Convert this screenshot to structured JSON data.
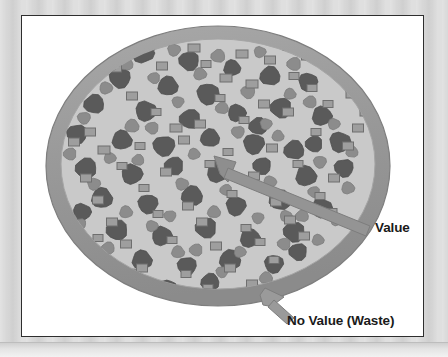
{
  "diagram": {
    "type": "conceptual-illustration",
    "labels": {
      "value": "Value",
      "no_value": "No Value (Waste)"
    },
    "colors": {
      "backdrop": "#d6d6d6",
      "panel_background": "#ffffff",
      "panel_border": "#2e2e2e",
      "disc_rim": "#9a9a9a",
      "disc_rim_edge": "#7e7e7e",
      "disc_interior": "#c9c9c9",
      "particle_dark": "#5a5a5a",
      "particle_medium": "#8c8c8c",
      "square_fill": "#9e9e9e",
      "square_border": "#6e6e6e",
      "arrow": "#8e8e8e",
      "arrow_edge": "#777777",
      "label_text": "#1a1a1a"
    },
    "legend_semantics": [
      {
        "shape": "circle-dark",
        "meaning": "Value"
      },
      {
        "shape": "circle-medium",
        "meaning": "Value"
      },
      {
        "shape": "square",
        "meaning": "Value"
      },
      {
        "shape": "rim-annulus",
        "meaning": "No Value (Waste)"
      }
    ],
    "disc": {
      "center_x": 196,
      "center_y": 148,
      "outer_rx": 172,
      "outer_ry": 140,
      "rim_thickness": 15
    },
    "callouts": [
      {
        "name": "value",
        "label": "Value",
        "tip_x": 192,
        "tip_y": 140,
        "tail_x": 348,
        "tail_y": 214
      },
      {
        "name": "no-value",
        "label": "No Value (Waste)",
        "tip_x": 243,
        "tip_y": 272,
        "tail_x": 268,
        "tail_y": 300
      }
    ],
    "particles_dark": [
      [
        121,
        37,
        17,
        15
      ],
      [
        167,
        45,
        15,
        14
      ],
      [
        210,
        52,
        12,
        11
      ],
      [
        98,
        62,
        16,
        15
      ],
      [
        146,
        70,
        15,
        14
      ],
      [
        186,
        78,
        17,
        16
      ],
      [
        248,
        60,
        15,
        14
      ],
      [
        286,
        66,
        14,
        13
      ],
      [
        72,
        88,
        15,
        14
      ],
      [
        124,
        95,
        16,
        15
      ],
      [
        168,
        103,
        16,
        14
      ],
      [
        215,
        97,
        13,
        12
      ],
      [
        259,
        92,
        16,
        15
      ],
      [
        300,
        100,
        15,
        14
      ],
      [
        55,
        118,
        15,
        14
      ],
      [
        100,
        124,
        15,
        14
      ],
      [
        142,
        130,
        17,
        15
      ],
      [
        188,
        122,
        14,
        13
      ],
      [
        232,
        128,
        16,
        15
      ],
      [
        272,
        134,
        15,
        14
      ],
      [
        318,
        126,
        16,
        15
      ],
      [
        64,
        152,
        16,
        15
      ],
      [
        110,
        158,
        16,
        15
      ],
      [
        152,
        150,
        14,
        13
      ],
      [
        196,
        156,
        17,
        16
      ],
      [
        240,
        150,
        13,
        12
      ],
      [
        284,
        160,
        16,
        15
      ],
      [
        322,
        152,
        14,
        13
      ],
      [
        80,
        182,
        16,
        15
      ],
      [
        126,
        188,
        15,
        14
      ],
      [
        170,
        180,
        16,
        15
      ],
      [
        214,
        190,
        15,
        14
      ],
      [
        258,
        184,
        16,
        15
      ],
      [
        300,
        192,
        15,
        14
      ],
      [
        95,
        214,
        16,
        15
      ],
      [
        140,
        220,
        15,
        14
      ],
      [
        184,
        212,
        16,
        15
      ],
      [
        228,
        222,
        15,
        14
      ],
      [
        272,
        216,
        16,
        15
      ],
      [
        120,
        244,
        15,
        14
      ],
      [
        165,
        250,
        14,
        13
      ],
      [
        208,
        244,
        16,
        15
      ],
      [
        252,
        248,
        14,
        13
      ],
      [
        188,
        266,
        13,
        12
      ],
      [
        146,
        272,
        12,
        11
      ],
      [
        236,
        110,
        13,
        12
      ],
      [
        60,
        196,
        13,
        12
      ],
      [
        292,
        128,
        12,
        11
      ],
      [
        104,
        278,
        12,
        11
      ],
      [
        276,
        236,
        13,
        12
      ]
    ],
    "particles_medium": [
      [
        104,
        48,
        11,
        10
      ],
      [
        152,
        34,
        10,
        9
      ],
      [
        196,
        40,
        11,
        10
      ],
      [
        238,
        36,
        9,
        8
      ],
      [
        272,
        48,
        11,
        10
      ],
      [
        84,
        72,
        10,
        9
      ],
      [
        132,
        62,
        9,
        8
      ],
      [
        178,
        58,
        10,
        9
      ],
      [
        226,
        76,
        11,
        10
      ],
      [
        268,
        78,
        9,
        8
      ],
      [
        62,
        102,
        10,
        9
      ],
      [
        110,
        110,
        11,
        10
      ],
      [
        156,
        86,
        9,
        8
      ],
      [
        200,
        92,
        10,
        9
      ],
      [
        244,
        108,
        9,
        8
      ],
      [
        288,
        86,
        10,
        9
      ],
      [
        312,
        108,
        9,
        8
      ],
      [
        48,
        138,
        10,
        9
      ],
      [
        88,
        142,
        9,
        8
      ],
      [
        130,
        112,
        10,
        9
      ],
      [
        172,
        138,
        9,
        8
      ],
      [
        216,
        116,
        10,
        9
      ],
      [
        256,
        120,
        9,
        8
      ],
      [
        298,
        146,
        10,
        9
      ],
      [
        330,
        136,
        9,
        8
      ],
      [
        72,
        168,
        10,
        9
      ],
      [
        116,
        144,
        9,
        8
      ],
      [
        160,
        168,
        10,
        9
      ],
      [
        204,
        174,
        9,
        8
      ],
      [
        248,
        166,
        10,
        9
      ],
      [
        292,
        176,
        9,
        8
      ],
      [
        326,
        172,
        10,
        9
      ],
      [
        58,
        208,
        9,
        8
      ],
      [
        104,
        196,
        10,
        9
      ],
      [
        148,
        200,
        9,
        8
      ],
      [
        192,
        196,
        10,
        9
      ],
      [
        236,
        202,
        9,
        8
      ],
      [
        280,
        200,
        10,
        9
      ],
      [
        314,
        204,
        9,
        8
      ],
      [
        86,
        232,
        10,
        9
      ],
      [
        130,
        210,
        9,
        8
      ],
      [
        174,
        234,
        10,
        9
      ],
      [
        218,
        236,
        9,
        8
      ],
      [
        262,
        228,
        10,
        9
      ],
      [
        296,
        224,
        9,
        8
      ],
      [
        110,
        258,
        9,
        8
      ],
      [
        156,
        236,
        10,
        9
      ],
      [
        200,
        256,
        9,
        8
      ],
      [
        244,
        262,
        10,
        9
      ],
      [
        176,
        284,
        9,
        8
      ],
      [
        218,
        282,
        10,
        9
      ],
      [
        134,
        290,
        9,
        8
      ],
      [
        88,
        256,
        9,
        8
      ],
      [
        264,
        200,
        9,
        8
      ]
    ],
    "squares": [
      [
        126,
        30,
        13,
        8
      ],
      [
        172,
        32,
        12,
        8
      ],
      [
        94,
        52,
        11,
        8
      ],
      [
        220,
        38,
        12,
        8
      ],
      [
        266,
        30,
        10,
        8
      ],
      [
        286,
        40,
        13,
        8
      ],
      [
        58,
        74,
        12,
        8
      ],
      [
        140,
        50,
        11,
        8
      ],
      [
        204,
        62,
        12,
        8
      ],
      [
        248,
        44,
        11,
        8
      ],
      [
        314,
        54,
        12,
        8
      ],
      [
        46,
        92,
        13,
        8
      ],
      [
        110,
        80,
        11,
        8
      ],
      [
        184,
        48,
        10,
        7
      ],
      [
        230,
        68,
        12,
        8
      ],
      [
        272,
        60,
        10,
        7
      ],
      [
        330,
        78,
        12,
        8
      ],
      [
        68,
        116,
        11,
        8
      ],
      [
        154,
        112,
        12,
        8
      ],
      [
        198,
        82,
        10,
        7
      ],
      [
        242,
        88,
        11,
        8
      ],
      [
        290,
        72,
        10,
        7
      ],
      [
        344,
        96,
        12,
        8
      ],
      [
        52,
        126,
        11,
        8
      ],
      [
        134,
        96,
        10,
        7
      ],
      [
        178,
        108,
        11,
        8
      ],
      [
        222,
        104,
        10,
        7
      ],
      [
        266,
        96,
        11,
        8
      ],
      [
        306,
        88,
        10,
        7
      ],
      [
        336,
        112,
        11,
        8
      ],
      [
        82,
        134,
        12,
        8
      ],
      [
        118,
        130,
        10,
        7
      ],
      [
        162,
        124,
        11,
        8
      ],
      [
        206,
        136,
        10,
        7
      ],
      [
        250,
        132,
        11,
        8
      ],
      [
        294,
        116,
        10,
        7
      ],
      [
        326,
        130,
        11,
        8
      ],
      [
        64,
        162,
        11,
        8
      ],
      [
        100,
        150,
        10,
        7
      ],
      [
        144,
        156,
        11,
        8
      ],
      [
        188,
        148,
        10,
        7
      ],
      [
        232,
        160,
        11,
        8
      ],
      [
        276,
        148,
        10,
        7
      ],
      [
        312,
        162,
        11,
        8
      ],
      [
        76,
        184,
        11,
        8
      ],
      [
        122,
        172,
        10,
        7
      ],
      [
        166,
        190,
        11,
        8
      ],
      [
        210,
        178,
        10,
        7
      ],
      [
        254,
        186,
        11,
        8
      ],
      [
        298,
        180,
        10,
        7
      ],
      [
        90,
        206,
        11,
        8
      ],
      [
        136,
        198,
        10,
        7
      ],
      [
        180,
        206,
        11,
        8
      ],
      [
        224,
        212,
        10,
        7
      ],
      [
        268,
        204,
        11,
        8
      ],
      [
        104,
        228,
        11,
        8
      ],
      [
        150,
        224,
        10,
        7
      ],
      [
        194,
        230,
        11,
        8
      ],
      [
        238,
        226,
        10,
        7
      ],
      [
        282,
        220,
        11,
        8
      ],
      [
        120,
        252,
        11,
        8
      ],
      [
        164,
        258,
        10,
        7
      ],
      [
        208,
        252,
        11,
        8
      ],
      [
        252,
        244,
        10,
        7
      ],
      [
        142,
        278,
        11,
        8
      ],
      [
        186,
        272,
        10,
        7
      ],
      [
        230,
        268,
        11,
        8
      ],
      [
        172,
        296,
        11,
        8
      ],
      [
        76,
        222,
        10,
        7
      ],
      [
        310,
        196,
        10,
        7
      ]
    ]
  }
}
